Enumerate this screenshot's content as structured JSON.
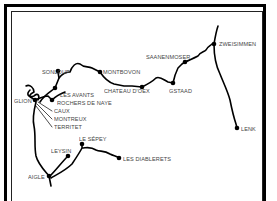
{
  "map": {
    "title": "Railway route map - Montreux / Gstaad / Zweisimmen region",
    "stations": [
      {
        "id": "zweisimmen",
        "label": "ZWEISIMMEN"
      },
      {
        "id": "saanenmoser",
        "label": "SAANENMOSER"
      },
      {
        "id": "gstaad",
        "label": "GSTAAD"
      },
      {
        "id": "lenk",
        "label": "LENK"
      },
      {
        "id": "chateau-doex",
        "label": "CHATEAU D'OEX"
      },
      {
        "id": "montbovon",
        "label": "MONTBOVON"
      },
      {
        "id": "sonloup",
        "label": "SONLOUP"
      },
      {
        "id": "les-avants",
        "label": "LES AVANTS"
      },
      {
        "id": "rochers-de-naye",
        "label": "ROCHERS DE NAYE"
      },
      {
        "id": "glion",
        "label": "GLION"
      },
      {
        "id": "caux",
        "label": "CAUX"
      },
      {
        "id": "montreux",
        "label": "MONTREUX"
      },
      {
        "id": "territet",
        "label": "TERRITET"
      },
      {
        "id": "le-sepey",
        "label": "LE SÉPEY"
      },
      {
        "id": "leysin",
        "label": "LEYSIN"
      },
      {
        "id": "les-diablerets",
        "label": "LES DIABLERETS"
      },
      {
        "id": "aigle",
        "label": "AIGLE"
      }
    ],
    "colors": {
      "line": "#000000",
      "label": "#444444",
      "background": "#ffffff"
    }
  }
}
